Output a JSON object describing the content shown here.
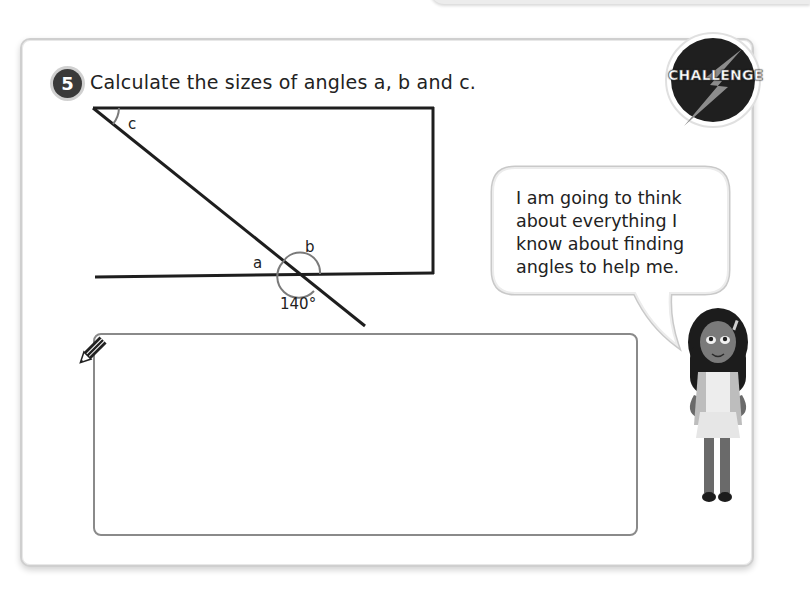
{
  "question": {
    "number": "5",
    "text": "Calculate the sizes of angles a, b and c."
  },
  "badge": {
    "label": "CHALLENGE",
    "icon": "lightning-bolt-icon"
  },
  "diagram": {
    "labels": {
      "a": "a",
      "b": "b",
      "c": "c",
      "given_angle": "140°"
    }
  },
  "speech_bubble": {
    "text": "I am going to think about everything I know about finding angles to help me."
  },
  "answer_area": {
    "icon": "pencil-icon",
    "value": ""
  },
  "character": {
    "icon": "girl-character-illustration"
  },
  "colors": {
    "badge_dark": "#3a3a3a",
    "line": "#1e1e1e",
    "arc": "#7a7a7a",
    "panel_border": "#cfcfcf",
    "answer_border": "#8a8a8a"
  }
}
